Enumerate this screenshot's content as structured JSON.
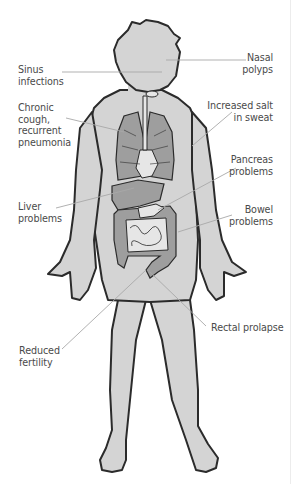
{
  "figure": {
    "colors": {
      "body_fill": "#d4d4d4",
      "outline": "#2b2b2b",
      "organ_fill": "#9e9e9e",
      "organ_light": "#e6e6e6",
      "leader_line": "#a8a8a8",
      "label_text": "#4a4a4a"
    }
  },
  "labels": {
    "sinus": "Sinus\ninfections",
    "nasal": "Nasal\npolyps",
    "cough": "Chronic\ncough,\nrecurrent\npneumonia",
    "salt": "Increased salt\nin sweat",
    "pancreas": "Pancreas\nproblems",
    "liver": "Liver\nproblems",
    "bowel": "Bowel\nproblems",
    "rectal": "Rectal prolapse",
    "fertility": "Reduced\nfertility"
  }
}
